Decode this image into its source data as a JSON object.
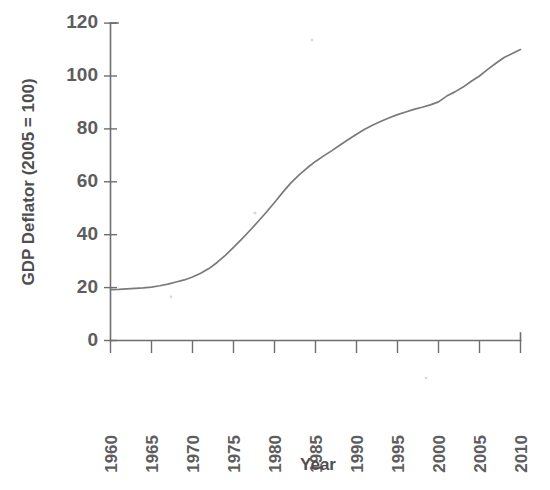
{
  "chart_data": {
    "type": "line",
    "title": "",
    "xlabel": "Year",
    "ylabel": "GDP Deflator (2005 = 100)",
    "xlim": [
      1960,
      2010
    ],
    "ylim": [
      0,
      120
    ],
    "grid": false,
    "legend": null,
    "line_color": "#7a7a7a",
    "axis_color": "#6e6e6e",
    "label_color": "#5d5d5d",
    "xticks": [
      1960,
      1965,
      1970,
      1975,
      1980,
      1985,
      1990,
      1995,
      2000,
      2005,
      2010
    ],
    "xtick_labels": [
      "1960",
      "1965",
      "1970",
      "1975",
      "1980",
      "1985",
      "1990",
      "1995",
      "2000",
      "2005",
      "2010"
    ],
    "xtick_rotation": 90,
    "yticks": [
      0,
      20,
      40,
      60,
      80,
      100,
      120
    ],
    "ytick_labels": [
      "0",
      "20",
      "40",
      "60",
      "80",
      "100",
      "120"
    ],
    "series": [
      {
        "name": "GDP Deflator",
        "x": [
          1960,
          1961,
          1962,
          1963,
          1964,
          1965,
          1966,
          1967,
          1968,
          1969,
          1970,
          1971,
          1972,
          1973,
          1974,
          1975,
          1976,
          1977,
          1978,
          1979,
          1980,
          1981,
          1982,
          1983,
          1984,
          1985,
          1986,
          1987,
          1988,
          1989,
          1990,
          1991,
          1992,
          1993,
          1994,
          1995,
          1996,
          1997,
          1998,
          1999,
          2000,
          2001,
          2002,
          2003,
          2004,
          2005,
          2006,
          2007,
          2008,
          2009,
          2010
        ],
        "values": [
          19.2,
          19.3,
          19.5,
          19.7,
          19.9,
          20.2,
          20.7,
          21.3,
          22.1,
          22.9,
          24.0,
          25.4,
          27.2,
          29.5,
          32.2,
          35.2,
          38.3,
          41.6,
          45.0,
          48.5,
          52.2,
          56.0,
          59.6,
          62.6,
          65.3,
          67.7,
          69.8,
          71.8,
          73.9,
          76.0,
          78.0,
          79.9,
          81.5,
          82.9,
          84.2,
          85.4,
          86.4,
          87.4,
          88.2,
          89.1,
          90.2,
          92.4,
          94.0,
          95.8,
          98.0,
          100.0,
          102.5,
          104.8,
          107.0,
          108.5,
          110.0
        ]
      }
    ],
    "annotations": []
  }
}
